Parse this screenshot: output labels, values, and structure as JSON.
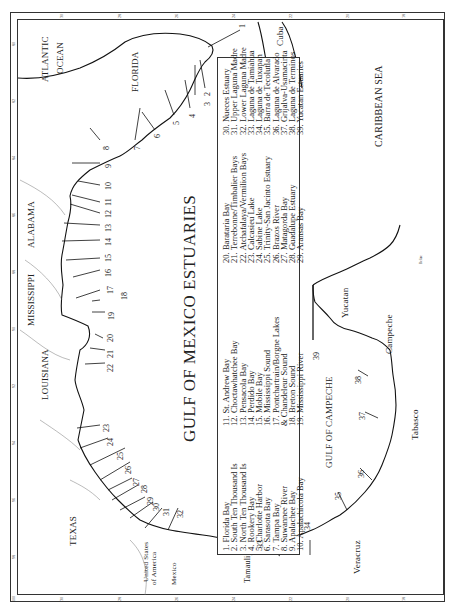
{
  "map": {
    "title": "GULF OF MEXICO ESTUARIES",
    "orientation": "rotated 90 degrees counter-clockwise",
    "regions": {
      "atlantic": "ATLANTIC",
      "ocean": "OCEAN",
      "florida": "FLORIDA",
      "alabama": "ALABAMA",
      "mississippi": "MISSISSIPPI",
      "louisiana": "LOUISIANA",
      "texas": "TEXAS",
      "usa_line1": "United States",
      "usa_line2": "of America",
      "mexico": "Mexico",
      "tamaulipas": "Tamaulipas",
      "veracruz": "Veracruz",
      "tabasco": "Tabasco",
      "campeche": "Campeche",
      "yucatan": "Yucatan",
      "cuba": "Cuba",
      "caribbean": "CARIBBEAN SEA",
      "gulf_campeche": "GULF OF CAMPECHE",
      "belize": "Belize"
    },
    "longitude_ticks": [
      "80",
      "82",
      "84",
      "86",
      "88",
      "90",
      "92",
      "94",
      "96",
      "98",
      "100"
    ],
    "latitude_ticks": [
      "30",
      "28",
      "26",
      "24",
      "22",
      "20",
      "18"
    ]
  },
  "legend": {
    "col1": [
      "1.  Florida Bay",
      "2.  South Ten Thousand Is",
      "3.  North Ten Thousand Is",
      "4.  Rookery Bay",
      "5.  Charlotte Harbor",
      "6.  Sarasota Bay",
      "7.  Tampa Bay",
      "8.  Suwannee River",
      "9.  Apalachee Bay",
      "10. Apalachicola Bay"
    ],
    "col2": [
      "11. St. Andrew Bay",
      "12. Choctawhatchee Bay",
      "13. Pensacola Bay",
      "14. Perdido Bay",
      "15. Mobile Bay",
      "16. Mississippi  Sound",
      "17. Pontchartrain/Borgne Lakes",
      "      & Chandeleur  Sound",
      "18. Breton Sound",
      "19. Mississippi River"
    ],
    "col3": [
      "20. Barataria Bay",
      "21. Terrebonne/Timbalier Bays",
      "22. Atchafalaya/Vermilion Bays",
      "23. Calcasieu Lake",
      "24. Sabine Lake",
      "25. Trinity-San Jacinto Estuary",
      "26. Brazos River",
      "27. Matagorda Bay",
      "28. Guadalupe Estuary",
      "29. Aransas Bay"
    ],
    "col4": [
      "30. Nueces Estuary",
      "31. Upper Laguna Madre",
      "32. Lower Laguna Madre",
      "33. Laguna de Tamiahua",
      "34. Laguna de Tuxapan",
      "35. Barra de Tecolutla",
      "36. Laguna de Alvarado",
      "37. Grijalva-Usamacinta",
      "38. Laguna de Terminos",
      "39. Yucatan Estuaries"
    ]
  },
  "callouts": [
    "1",
    "2",
    "3",
    "4",
    "5",
    "6",
    "7",
    "8",
    "9",
    "10",
    "11",
    "12",
    "13",
    "14",
    "15",
    "16",
    "17",
    "18",
    "19",
    "20",
    "21",
    "22",
    "23",
    "24",
    "25",
    "26",
    "27",
    "28",
    "29",
    "30",
    "31",
    "32",
    "33",
    "34",
    "35",
    "36",
    "37",
    "38",
    "39"
  ]
}
